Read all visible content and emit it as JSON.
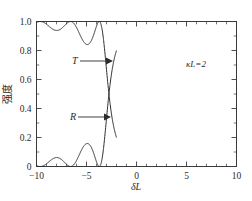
{
  "figure": {
    "background_color": "#ffffff",
    "frame_color": "#3a3a3a",
    "curve_color": "#2b2b2b"
  },
  "axes": {
    "x_label": "δL",
    "y_label": "强度",
    "x_ticks": [
      "−10",
      "−5",
      "0",
      "5",
      "10"
    ],
    "x_tick_values": [
      -10,
      -5,
      0,
      5,
      10
    ],
    "y_ticks": [
      "0",
      "0.2",
      "0.4",
      "0.6",
      "0.8",
      "1.0"
    ],
    "y_tick_values": [
      0,
      0.2,
      0.4,
      0.6,
      0.8,
      1.0
    ],
    "xlim": [
      -10,
      10
    ],
    "ylim": [
      0,
      1.0
    ]
  },
  "annotations": {
    "parameter": "κL=2",
    "transmission_label": "T",
    "reflection_label": "R"
  },
  "chart_data": {
    "type": "line",
    "title": "",
    "xlabel": "δL",
    "ylabel": "强度",
    "xlim": [
      -10,
      10
    ],
    "ylim": [
      0,
      1.0
    ],
    "grid": false,
    "legend": "inline-arrow-labels",
    "parameter": {
      "name": "κL",
      "value": 2
    },
    "series": [
      {
        "name": "R",
        "label": "R",
        "description": "Reflectivity of uniform Bragg grating, R = sinh^2(sL)/(cosh^2(sL) - (dL/kL)^2) form; central peak 0.94 at dL=0, sidelobes 0.18 at dL=±5.3 and 0.07 at dL=±8.1",
        "peak_value": 0.94,
        "peak_x": 0,
        "sidelobe_peaks": [
          {
            "x": -8.1,
            "y": 0.07
          },
          {
            "x": -5.3,
            "y": 0.18
          },
          {
            "x": 5.3,
            "y": 0.18
          },
          {
            "x": 8.1,
            "y": 0.07
          }
        ],
        "zeros_x": [
          -9.3,
          -6.8,
          -3.7,
          3.7,
          6.8,
          9.3
        ],
        "x": [
          -10.0,
          -9.6,
          -9.3,
          -9.0,
          -8.6,
          -8.1,
          -7.7,
          -7.3,
          -6.8,
          -6.4,
          -6.0,
          -5.7,
          -5.3,
          -5.0,
          -4.6,
          -4.2,
          -3.9,
          -3.7,
          -3.4,
          -3.0,
          -2.6,
          -2.2,
          -1.8,
          -1.4,
          -1.0,
          -0.6,
          -0.2,
          0.2,
          0.6,
          1.0,
          1.4,
          1.8,
          2.2,
          2.6,
          3.0,
          3.4,
          3.7,
          3.9,
          4.2,
          4.6,
          5.0,
          5.3,
          5.7,
          6.0,
          6.4,
          6.8,
          7.3,
          7.7,
          8.1,
          8.6,
          9.0,
          9.3,
          9.6,
          10.0
        ],
        "y": [
          0.035,
          0.012,
          0.0,
          0.014,
          0.045,
          0.07,
          0.05,
          0.02,
          0.0,
          0.035,
          0.11,
          0.165,
          0.18,
          0.16,
          0.1,
          0.03,
          0.002,
          0.0,
          0.06,
          0.3,
          0.58,
          0.77,
          0.865,
          0.91,
          0.93,
          0.938,
          0.94,
          0.94,
          0.938,
          0.93,
          0.91,
          0.865,
          0.77,
          0.58,
          0.3,
          0.06,
          0.0,
          0.002,
          0.03,
          0.1,
          0.16,
          0.18,
          0.165,
          0.11,
          0.035,
          0.0,
          0.02,
          0.05,
          0.07,
          0.045,
          0.014,
          0.0,
          0.012,
          0.035
        ]
      },
      {
        "name": "T",
        "label": "T",
        "description": "Transmission T = 1 - R, complementary to reflectivity",
        "min_value": 0.06,
        "min_x": 0,
        "x": [
          -10.0,
          -9.6,
          -9.3,
          -9.0,
          -8.6,
          -8.1,
          -7.7,
          -7.3,
          -6.8,
          -6.4,
          -6.0,
          -5.7,
          -5.3,
          -5.0,
          -4.6,
          -4.2,
          -3.9,
          -3.7,
          -3.4,
          -3.0,
          -2.6,
          -2.2,
          -1.8,
          -1.4,
          -1.0,
          -0.6,
          -0.2,
          0.2,
          0.6,
          1.0,
          1.4,
          1.8,
          2.2,
          2.6,
          3.0,
          3.4,
          3.7,
          3.9,
          4.2,
          4.6,
          5.0,
          5.3,
          5.7,
          6.0,
          6.4,
          6.8,
          7.3,
          7.7,
          8.1,
          8.6,
          9.0,
          9.3,
          9.6,
          10.0
        ],
        "y": [
          0.965,
          0.988,
          1.0,
          0.986,
          0.955,
          0.93,
          0.95,
          0.98,
          1.0,
          0.965,
          0.89,
          0.835,
          0.82,
          0.84,
          0.9,
          0.97,
          0.998,
          1.0,
          0.94,
          0.7,
          0.42,
          0.23,
          0.135,
          0.09,
          0.07,
          0.062,
          0.06,
          0.06,
          0.062,
          0.07,
          0.09,
          0.135,
          0.23,
          0.42,
          0.7,
          0.94,
          1.0,
          0.998,
          0.97,
          0.9,
          0.84,
          0.82,
          0.835,
          0.89,
          0.965,
          1.0,
          0.98,
          0.95,
          0.93,
          0.955,
          0.986,
          1.0,
          0.988,
          0.965
        ]
      }
    ]
  }
}
